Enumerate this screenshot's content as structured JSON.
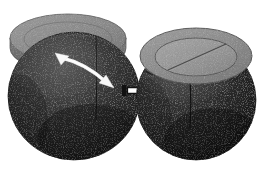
{
  "figure": {
    "title": "Capsule lid placement sequence",
    "background_color": "#ffffff",
    "width": 269,
    "height": 172,
    "panels": [
      {
        "id": "before",
        "name": "capsule-open",
        "caption": "",
        "body": {
          "name": "capsule-body",
          "fill": "#2e2e2e",
          "shade_light": "#4a4a4a",
          "shade_dark": "#1d1d1d",
          "cx": 74,
          "cy": 96,
          "rx": 66,
          "ry": 64
        },
        "lid": {
          "name": "capsule-lid-displaced",
          "fill": "#8d8d8d",
          "rim_fill": "#6f6f6f",
          "edge": "#5d5d5d",
          "cx": 68,
          "cy": 40,
          "rx": 58,
          "ry": 24,
          "state": "tilted"
        },
        "seam": {
          "name": "body-seam-line",
          "color": "#1a1a1a"
        },
        "motion_arrow": {
          "name": "motion-arrow",
          "color": "#ffffff",
          "heads": 2,
          "shape": "curved",
          "from_x": 60,
          "from_y": 57,
          "to_x": 108,
          "to_y": 84
        }
      },
      {
        "id": "after",
        "name": "capsule-closed",
        "caption": "",
        "body": {
          "name": "capsule-body",
          "fill": "#2b2b2b",
          "shade_light": "#454545",
          "shade_dark": "#191919",
          "cx": 196,
          "cy": 100,
          "rx": 60,
          "ry": 60
        },
        "lid": {
          "name": "capsule-lid-seated",
          "fill": "#8f8f8f",
          "inner_fill": "#9a9a9a",
          "edge": "#5a5a5a",
          "cx": 196,
          "cy": 56,
          "rx": 56,
          "ry": 28,
          "state": "seated",
          "inner_rx": 41,
          "inner_ry": 19,
          "slot_line": true
        },
        "seam": {
          "name": "body-seam-line",
          "color": "#151515"
        }
      }
    ],
    "transition_arrow": {
      "name": "transition-arrow",
      "direction": "right",
      "stroke": "#000000",
      "fill": "#ffffff",
      "tail_fill": "#000000",
      "x": 122,
      "y": 84,
      "width": 26,
      "height": 16
    }
  }
}
